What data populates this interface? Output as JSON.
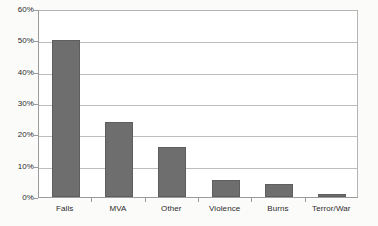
{
  "chart_data": {
    "type": "bar",
    "title": "",
    "subtitle": "",
    "xlabel": "",
    "ylabel": "",
    "categories": [
      "Falls",
      "MVA",
      "Other",
      "Violence",
      "Burns",
      "Terror/War"
    ],
    "values": [
      50,
      24,
      16,
      5.5,
      4,
      1
    ],
    "series": [
      {
        "name": "Percent of injuries",
        "values": [
          50,
          24,
          16,
          5.5,
          4,
          1
        ]
      }
    ],
    "ylim": [
      0,
      60
    ],
    "ytick_values": [
      0,
      10,
      20,
      30,
      40,
      50,
      60
    ],
    "ytick_labels": [
      "0%",
      "10%",
      "20%",
      "30%",
      "40%",
      "50%",
      "60%"
    ],
    "grid": true,
    "grid_axis": "y",
    "legend": false,
    "legend_position": "none",
    "annotations": [],
    "bar_color": "#6e6e6e",
    "bar_edge_color": "#5e5e5e",
    "gridline_color": "#bdbdbd",
    "axis_color": "#9b9b9b",
    "plot_background": "#ffffff",
    "page_background": "#fbfbfa",
    "text_color": "#2b2b2b"
  }
}
